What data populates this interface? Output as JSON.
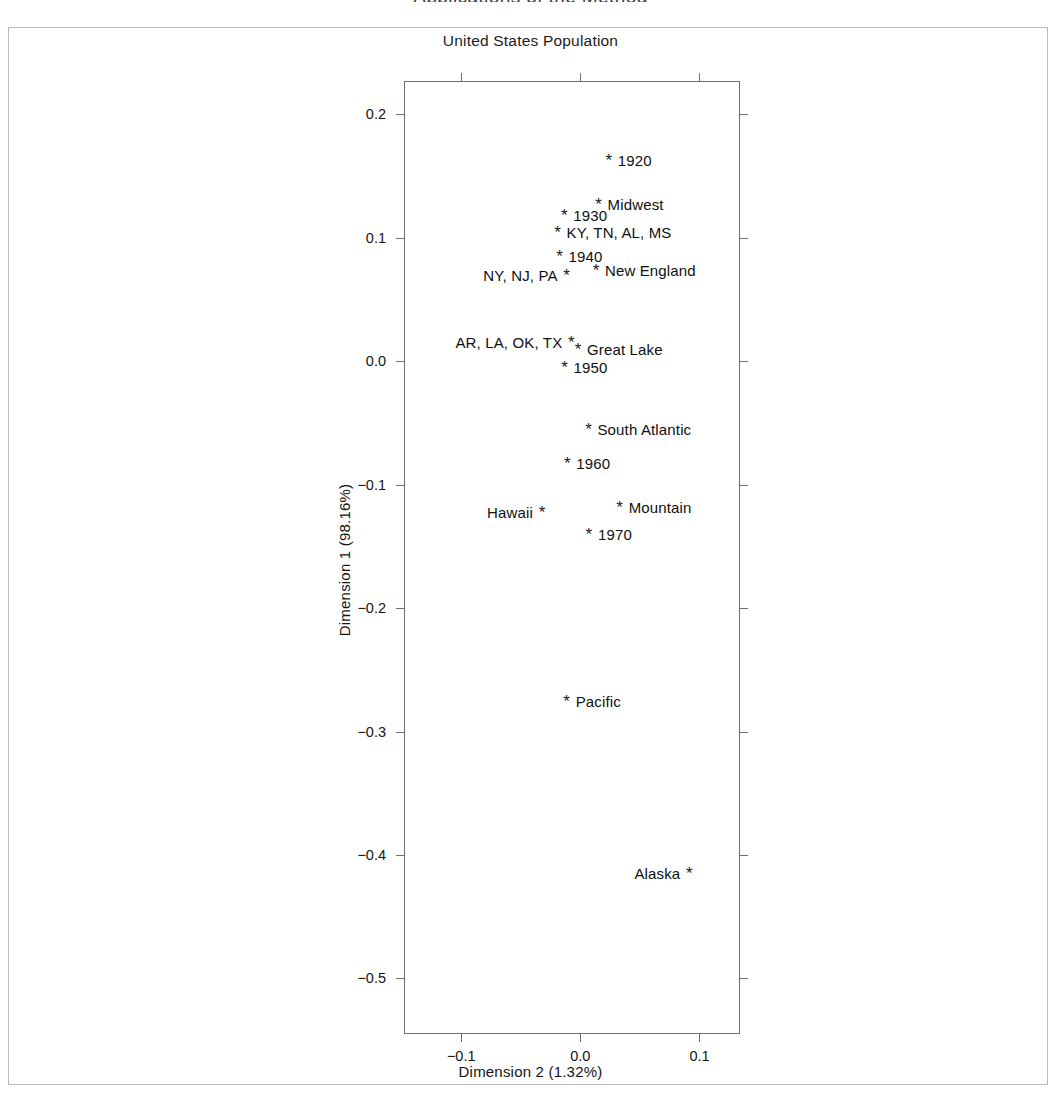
{
  "page": {
    "cropped_heading": "Applications of the Method",
    "figure_title": "United States Population"
  },
  "chart_data": {
    "type": "scatter",
    "title": "United States Population",
    "xlabel": "Dimension 2 (1.32%)",
    "ylabel": "Dimension 1 (98.16%)",
    "xlim": [
      -0.148,
      0.134
    ],
    "ylim": [
      -0.545,
      0.227
    ],
    "xticks": [
      -0.1,
      0.0,
      0.1
    ],
    "xticklabels": [
      "−0.1",
      "0.0",
      "0.1"
    ],
    "yticks": [
      0.2,
      0.1,
      0.0,
      -0.1,
      -0.2,
      -0.3,
      -0.4,
      -0.5
    ],
    "yticklabels": [
      "0.2",
      "0.1",
      "0.0",
      "−0.1",
      "−0.2",
      "−0.3",
      "−0.4",
      "−0.5"
    ],
    "grid": false,
    "legend": false,
    "marker": "*",
    "points": [
      {
        "label": "1920",
        "x": 0.0239,
        "y": 0.1628,
        "label_side": "right"
      },
      {
        "label": "Midwest",
        "x": 0.0153,
        "y": 0.1277,
        "label_side": "right"
      },
      {
        "label": "1930",
        "x": -0.0135,
        "y": 0.1183,
        "label_side": "right"
      },
      {
        "label": "KY, TN, AL, MS",
        "x": -0.0191,
        "y": 0.1043,
        "label_side": "right"
      },
      {
        "label": "1940",
        "x": -0.0175,
        "y": 0.0856,
        "label_side": "right"
      },
      {
        "label": "New England",
        "x": 0.0131,
        "y": 0.0739,
        "label_side": "right"
      },
      {
        "label": "NY, NJ, PA",
        "x": -0.0115,
        "y": 0.0699,
        "label_side": "left"
      },
      {
        "label": "Great Lake",
        "x": -0.002,
        "y": 0.0103,
        "label_side": "right"
      },
      {
        "label": "AR, LA, OK, TX",
        "x": -0.0076,
        "y": 0.0152,
        "label_side": "left"
      },
      {
        "label": "1950",
        "x": -0.0132,
        "y": -0.0043,
        "label_side": "right"
      },
      {
        "label": "South Atlantic",
        "x": 0.0068,
        "y": -0.0553,
        "label_side": "right"
      },
      {
        "label": "1960",
        "x": -0.0109,
        "y": -0.0827,
        "label_side": "right"
      },
      {
        "label": "Mountain",
        "x": 0.033,
        "y": -0.1183,
        "label_side": "right"
      },
      {
        "label": "Hawaii",
        "x": -0.0322,
        "y": -0.1222,
        "label_side": "left"
      },
      {
        "label": "1970",
        "x": 0.0072,
        "y": -0.1401,
        "label_side": "right"
      },
      {
        "label": "Pacific",
        "x": -0.0115,
        "y": -0.2751,
        "label_side": "right"
      },
      {
        "label": "Alaska",
        "x": 0.0915,
        "y": -0.4143,
        "label_side": "left"
      }
    ]
  }
}
